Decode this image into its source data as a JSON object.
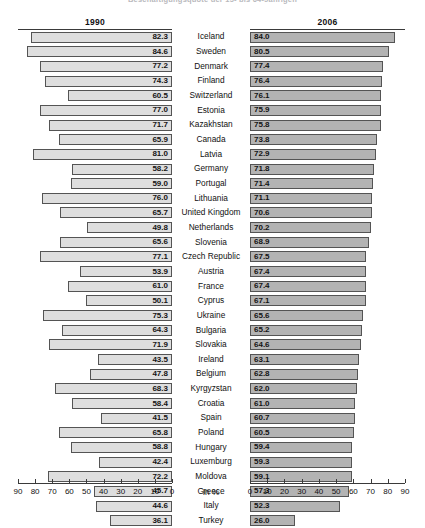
{
  "title": "Beschäftigungsquote der 15- bis 64-Jährigen",
  "headers": {
    "left": "1990",
    "right": "2006"
  },
  "axis_unit_label": "In %",
  "axis": {
    "left_ticks": [
      "90",
      "80",
      "70",
      "60",
      "50",
      "40",
      "30",
      "20",
      "10",
      "0"
    ],
    "right_ticks": [
      "0",
      "10",
      "20",
      "30",
      "40",
      "50",
      "60",
      "70",
      "80",
      "90"
    ],
    "min": 0,
    "max": 90
  },
  "colors": {
    "bar_1990": "#dedede",
    "bar_2006": "#b3b3b3",
    "bar_border": "#545454",
    "text": "#111111",
    "rule": "#3a3a3a"
  },
  "chart_data": {
    "type": "bar",
    "title": "Beschäftigungsquote der 15- bis 64-Jährigen",
    "subtype": "paired-horizontal-bidirectional",
    "xlabel": "In %",
    "ylabel": "",
    "xlim": [
      0,
      90
    ],
    "grid": false,
    "legend": "column-headers",
    "categories": [
      "Iceland",
      "Sweden",
      "Denmark",
      "Finland",
      "Switzerland",
      "Estonia",
      "Kazakhstan",
      "Canada",
      "Latvia",
      "Germany",
      "Portugal",
      "Lithuania",
      "United Kingdom",
      "Netherlands",
      "Slovenia",
      "Czech Republic",
      "Austria",
      "France",
      "Cyprus",
      "Ukraine",
      "Bulgaria",
      "Slovakia",
      "Ireland",
      "Belgium",
      "Kyrgyzstan",
      "Croatia",
      "Spain",
      "Poland",
      "Hungary",
      "Luxemburg",
      "Moldova",
      "Greece",
      "Italy",
      "Turkey"
    ],
    "series": [
      {
        "name": "1990",
        "direction": "left",
        "values": [
          82.3,
          84.6,
          77.2,
          74.3,
          60.5,
          77.0,
          71.7,
          65.9,
          81.0,
          58.2,
          59.0,
          76.0,
          65.7,
          49.8,
          65.6,
          77.1,
          53.9,
          61.0,
          50.1,
          75.3,
          64.3,
          71.9,
          43.5,
          47.8,
          68.3,
          58.4,
          41.5,
          65.8,
          58.8,
          42.4,
          72.2,
          45.7,
          44.6,
          36.1
        ]
      },
      {
        "name": "2006",
        "direction": "right",
        "values": [
          84.0,
          80.5,
          77.4,
          76.4,
          76.1,
          75.9,
          75.8,
          73.8,
          72.9,
          71.8,
          71.4,
          71.1,
          70.6,
          70.2,
          68.9,
          67.5,
          67.4,
          67.4,
          67.1,
          65.6,
          65.2,
          64.6,
          63.1,
          62.8,
          62.0,
          61.0,
          60.7,
          60.5,
          59.4,
          59.3,
          59.1,
          57.3,
          52.3,
          26.0
        ]
      }
    ]
  }
}
